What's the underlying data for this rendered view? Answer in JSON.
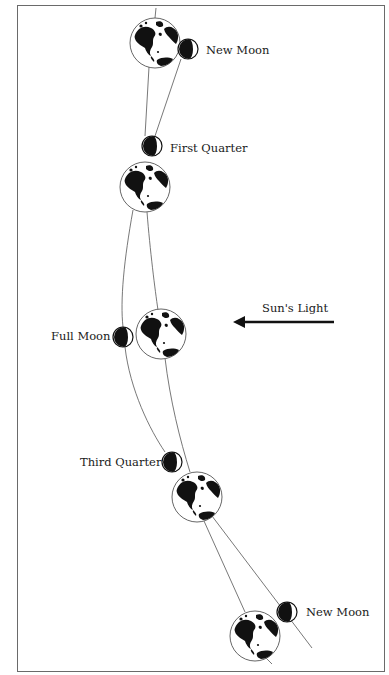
{
  "diagram": {
    "colors": {
      "ink": "#111111",
      "line": "#555555",
      "frame": "#6a6a6a",
      "background": "#ffffff"
    },
    "labels": {
      "new_moon_top": "New Moon",
      "first_quarter": "First Quarter",
      "full_moon": "Full Moon",
      "sun_light": "Sun's Light",
      "third_quarter": "Third Quarter",
      "new_moon_bottom": "New Moon"
    },
    "earths": [
      {
        "id": "earth-1",
        "cx": 155,
        "cy": 43,
        "r": 25
      },
      {
        "id": "earth-2",
        "cx": 145,
        "cy": 187,
        "r": 25
      },
      {
        "id": "earth-3",
        "cx": 161,
        "cy": 334,
        "r": 25
      },
      {
        "id": "earth-4",
        "cx": 197,
        "cy": 497,
        "r": 25
      },
      {
        "id": "earth-5",
        "cx": 255,
        "cy": 636,
        "r": 25
      }
    ],
    "moons": [
      {
        "id": "moon-new-top",
        "phase": "New Moon",
        "cx": 188,
        "cy": 49,
        "r": 10,
        "dark_side": "left"
      },
      {
        "id": "moon-first-quarter",
        "phase": "First Quarter",
        "cx": 152,
        "cy": 146,
        "r": 10,
        "dark_side": "left"
      },
      {
        "id": "moon-full",
        "phase": "Full Moon",
        "cx": 123,
        "cy": 337,
        "r": 10,
        "dark_side": "left"
      },
      {
        "id": "moon-third-quarter",
        "phase": "Third Quarter",
        "cx": 172,
        "cy": 462,
        "r": 10,
        "dark_side": "left"
      },
      {
        "id": "moon-new-bottom",
        "phase": "New Moon",
        "cx": 287,
        "cy": 612,
        "r": 10,
        "dark_side": "left"
      }
    ],
    "arrow": {
      "label": "Sun's Light",
      "direction": "left",
      "x1": 334,
      "x2": 233,
      "y": 322
    }
  }
}
